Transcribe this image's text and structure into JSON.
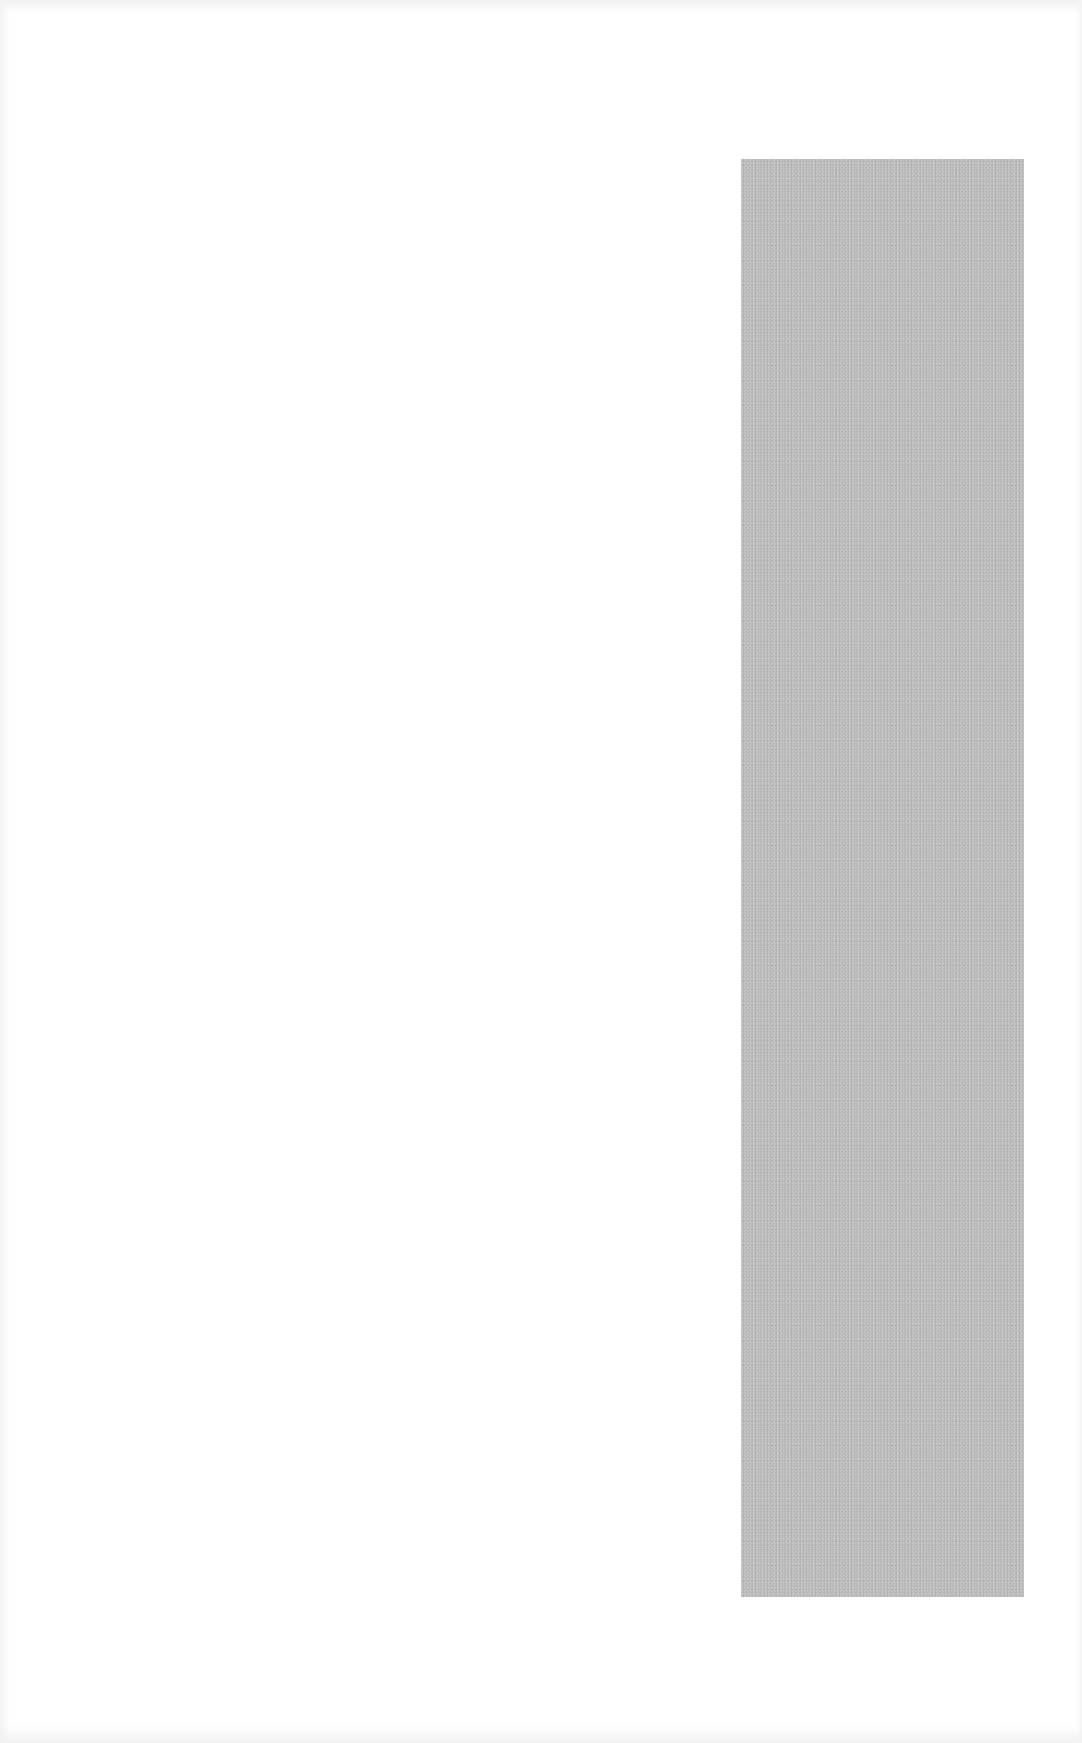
{
  "page": {
    "background_color": "#ffffff",
    "text": ""
  },
  "placeholder_block": {
    "color": "#bdbdbd",
    "label": ""
  }
}
